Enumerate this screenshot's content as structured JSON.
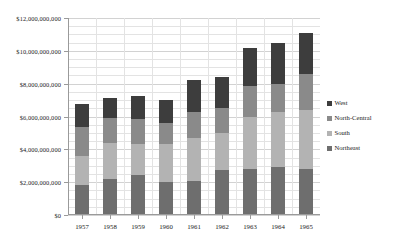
{
  "chart_data": {
    "type": "bar",
    "stacked": true,
    "title": "",
    "xlabel": "",
    "ylabel": "",
    "ylim": [
      0,
      12000000000
    ],
    "ytick_step": 2000000000,
    "minor_gridline_step": 500000000,
    "grid": true,
    "legend_position": "right",
    "categories": [
      "1957",
      "1958",
      "1959",
      "1960",
      "1961",
      "1962",
      "1963",
      "1964",
      "1965"
    ],
    "ytick_labels": [
      "$0",
      "$2,000,000,000",
      "$4,000,000,000",
      "$6,000,000,000",
      "$8,000,000,000",
      "$10,000,000,000",
      "$12,000,000,000"
    ],
    "ytick_values": [
      0,
      2000000000,
      4000000000,
      6000000000,
      8000000000,
      10000000000,
      12000000000
    ],
    "series": [
      {
        "name": "Northeast",
        "color": "#6e6e6e",
        "values": [
          1850000000,
          2200000000,
          2450000000,
          2000000000,
          2100000000,
          2750000000,
          2800000000,
          2900000000,
          2800000000
        ]
      },
      {
        "name": "South",
        "color": "#b3b3b3",
        "values": [
          1750000000,
          2200000000,
          1900000000,
          2350000000,
          2600000000,
          2250000000,
          3200000000,
          3400000000,
          3600000000
        ]
      },
      {
        "name": "North-Central",
        "color": "#8a8a8a",
        "values": [
          1750000000,
          1500000000,
          1500000000,
          1250000000,
          1600000000,
          1500000000,
          1850000000,
          1700000000,
          2200000000
        ]
      },
      {
        "name": "West",
        "color": "#3d3d3d",
        "values": [
          1400000000,
          1200000000,
          1400000000,
          1400000000,
          1950000000,
          1900000000,
          2350000000,
          2500000000,
          2500000000
        ]
      }
    ],
    "totals": [
      6750000000,
      7100000000,
      7250000000,
      7000000000,
      8250000000,
      8400000000,
      10200000000,
      10500000000,
      11100000000
    ],
    "legend_order": [
      "West",
      "North-Central",
      "South",
      "Northeast"
    ]
  },
  "legend": {
    "items": [
      {
        "label": "West",
        "color": "#3d3d3d"
      },
      {
        "label": "North-Central",
        "color": "#8a8a8a"
      },
      {
        "label": "South",
        "color": "#b3b3b3"
      },
      {
        "label": "Northeast",
        "color": "#6e6e6e"
      }
    ]
  }
}
